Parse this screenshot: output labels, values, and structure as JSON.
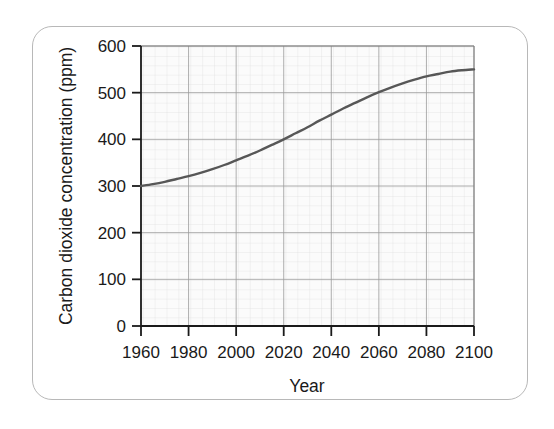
{
  "figure": {
    "background_color": "#ffffff",
    "frame_border_color": "#b8b8b8"
  },
  "chart_data": {
    "type": "line",
    "title": "",
    "subtitle": "",
    "xlabel": "Year",
    "ylabel": "Carbon dioxide concentration (ppm)",
    "xlim": [
      1960,
      2100
    ],
    "ylim": [
      0,
      600
    ],
    "xticks": [
      1960,
      1980,
      2000,
      2020,
      2040,
      2060,
      2080,
      2100
    ],
    "yticks": [
      0,
      100,
      200,
      300,
      400,
      500,
      600
    ],
    "xtick_labels": [
      "1960",
      "1980",
      "2000",
      "2020",
      "2040",
      "2060",
      "2080",
      "2100"
    ],
    "ytick_labels": [
      "0",
      "100",
      "200",
      "300",
      "400",
      "500",
      "600"
    ],
    "grid": true,
    "minor_grid": true,
    "major_grid_step_x": 20,
    "major_grid_step_y": 100,
    "minor_grid_step_x": 4,
    "minor_grid_step_y": 20,
    "legend": null,
    "legend_position": "none",
    "line_color": "#575757",
    "line_width": 2.4,
    "plot_background_color": "#fbfbfb",
    "series": [
      {
        "name": "Carbon dioxide concentration",
        "x": [
          1960,
          1965,
          1970,
          1975,
          1980,
          1985,
          1990,
          1995,
          2000,
          2005,
          2010,
          2015,
          2020,
          2025,
          2030,
          2035,
          2040,
          2045,
          2050,
          2055,
          2060,
          2065,
          2070,
          2075,
          2080,
          2085,
          2090,
          2095,
          2100
        ],
        "values": [
          300,
          304,
          309,
          315,
          321,
          328,
          336,
          345,
          355,
          365,
          376,
          388,
          400,
          413,
          426,
          440,
          453,
          466,
          478,
          490,
          501,
          511,
          520,
          528,
          535,
          540,
          545,
          548,
          550
        ]
      }
    ]
  },
  "annotations": {
    "ylabel_rotation": -90
  }
}
